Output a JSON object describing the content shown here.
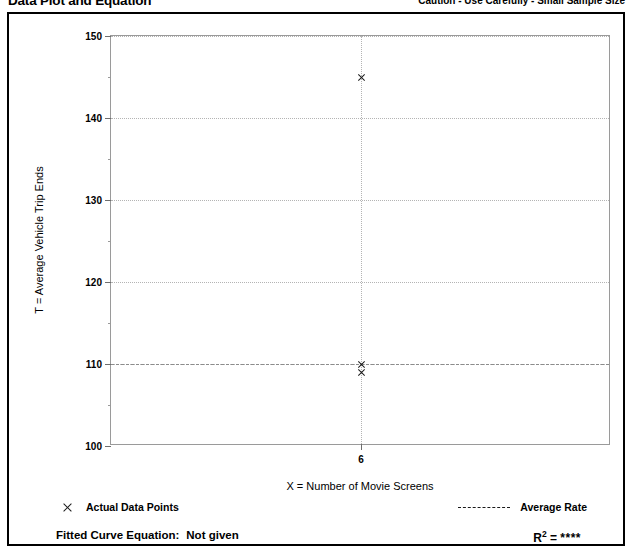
{
  "header": {
    "title": "Data Plot and Equation",
    "caution": "Caution - Use Carefully - Small Sample Size"
  },
  "legend": {
    "data_points_label": "Actual Data Points",
    "average_rate_label": "Average Rate",
    "marker_icon": "x-marker-icon",
    "line_icon": "dashed-line-icon"
  },
  "footer": {
    "fitted_label": "Fitted Curve Equation:",
    "fitted_value": "Not given",
    "r2_label": "R",
    "r2_exponent": "2",
    "r2_equals": "=",
    "r2_value": "****"
  },
  "chart_data": {
    "type": "scatter",
    "title": "Data Plot and Equation",
    "xlabel": "X = Number of Movie Screens",
    "ylabel": "T = Average Vehicle Trip Ends",
    "xlim": [
      0,
      12
    ],
    "ylim": [
      100,
      150
    ],
    "xticks": [
      6
    ],
    "xtick_labels": [
      "6"
    ],
    "yticks": [
      100,
      110,
      120,
      130,
      140,
      150
    ],
    "ytick_labels": [
      "100",
      "110",
      "120",
      "130",
      "140",
      "150"
    ],
    "yticks_minor": [
      105,
      115,
      125,
      135,
      145
    ],
    "grid": true,
    "grid_style": "dotted",
    "legend_position": "below-plot",
    "series": [
      {
        "name": "Actual Data Points",
        "marker": "x",
        "points": [
          {
            "x": 6,
            "y": 145
          },
          {
            "x": 6,
            "y": 110
          },
          {
            "x": 6,
            "y": 109
          }
        ]
      },
      {
        "name": "Average Rate",
        "type": "hline",
        "style": "dashed",
        "value": 110
      }
    ]
  }
}
